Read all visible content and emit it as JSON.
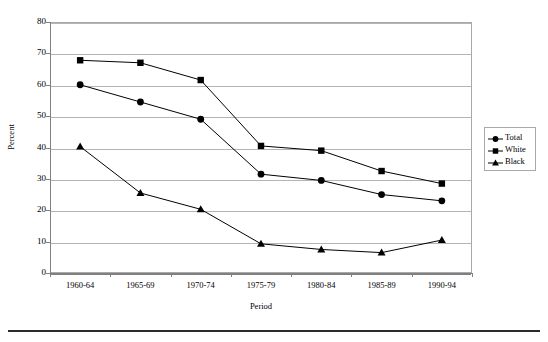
{
  "chart_data": {
    "type": "line",
    "title": "",
    "xlabel": "Period",
    "ylabel": "Percent",
    "categories": [
      "1960-64",
      "1965-69",
      "1970-74",
      "1975-79",
      "1980-84",
      "1985-89",
      "1990-94"
    ],
    "series": [
      {
        "name": "Total",
        "marker": "circle",
        "values": [
          60.0,
          54.5,
          49.0,
          31.5,
          29.5,
          25.0,
          23.0
        ]
      },
      {
        "name": "White",
        "marker": "square",
        "values": [
          67.8,
          67.0,
          61.5,
          40.5,
          39.0,
          32.5,
          28.5
        ]
      },
      {
        "name": "Black",
        "marker": "triangle",
        "values": [
          40.3,
          25.5,
          20.3,
          9.3,
          7.5,
          6.5,
          10.5
        ]
      }
    ],
    "ylim": [
      0,
      80
    ],
    "ytick_step": 10,
    "yticks": [
      "0",
      "10",
      "20",
      "30",
      "40",
      "50",
      "60",
      "70",
      "80"
    ],
    "grid": "horizontal",
    "legend_position": "right",
    "colors": {
      "series_line": "#000000",
      "marker": "#000000",
      "gridline": "#b4b4b4",
      "axis": "#808080",
      "plot_border": "#a9a9a9",
      "background": "#ffffff",
      "rule": "#2b2b2b"
    }
  },
  "legend": {
    "items": [
      {
        "label": "Total",
        "marker": "circle-marker"
      },
      {
        "label": "White",
        "marker": "square-marker"
      },
      {
        "label": "Black",
        "marker": "triangle-marker"
      }
    ]
  },
  "axes": {
    "y_title": "Percent",
    "x_title": "Period"
  }
}
